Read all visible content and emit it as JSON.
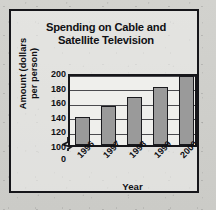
{
  "chart_data": {
    "type": "bar",
    "title": "Spending on Cable and Satellite Television",
    "title_line1": "Spending on Cable and",
    "title_line2": "Satellite Television",
    "xlabel": "Year",
    "ylabel": "Amount (dollars per person)",
    "ylabel_line1": "Amount (dollars",
    "ylabel_line2": "per person)",
    "categories": [
      "1996",
      "1997",
      "1998",
      "1999",
      "2000"
    ],
    "values": [
      138,
      153,
      166,
      180,
      194
    ],
    "yticks": [
      0,
      100,
      120,
      140,
      160,
      180,
      200
    ],
    "ytick_labels": [
      "0",
      "100",
      "120",
      "140",
      "160",
      "180",
      "200"
    ],
    "ylim": [
      100,
      200
    ],
    "axis_break": true,
    "grid": true,
    "legend": null,
    "bar_color": "#9a9a9a",
    "bar_edge_color": "#1a1a1e",
    "frame_color": "#16161a",
    "text_color": "#101014",
    "plot_background": "#efefec",
    "page_background": "#cfcfcb"
  }
}
